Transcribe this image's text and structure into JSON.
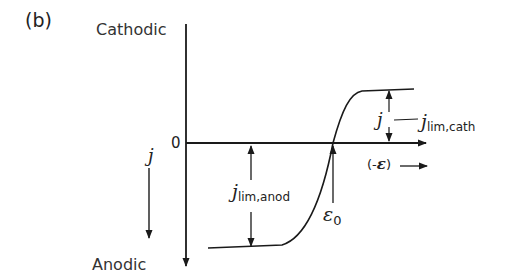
{
  "figure": {
    "panel_label": "(b)",
    "y_axis": {
      "top_label": "Cathodic",
      "bottom_label": "Anodic",
      "origin_label": "0",
      "direction_symbol": "j",
      "direction": "down"
    },
    "x_axis": {
      "label_open": "(-",
      "label_symbol": "ε",
      "label_close": ")",
      "direction": "right"
    },
    "annotations": {
      "cathodic_limit": {
        "symbol": "j",
        "subscript": "lim,cath",
        "marker_symbol": "j"
      },
      "anodic_limit": {
        "symbol": "j",
        "subscript": "lim,anod"
      },
      "equilibrium": {
        "symbol": "ε",
        "subscript": "0"
      }
    },
    "curve": {
      "description": "Sigmoidal current-potential curve with anodic limiting plateau (below zero), crossing zero at ε0, rising to cathodic limiting plateau",
      "anodic_plateau_y": 248,
      "zero_crossing_x": 333,
      "cathodic_plateau_y": 89
    },
    "colors": {
      "ink": "#1a1a1a",
      "background": "#ffffff"
    }
  }
}
